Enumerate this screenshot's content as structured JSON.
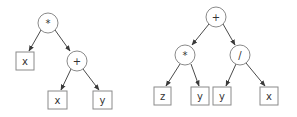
{
  "diagram": {
    "type": "expression-trees",
    "trees": [
      {
        "name": "tree-left",
        "expression": "x * (x + y)",
        "nodes": [
          {
            "id": "l0",
            "label": "*",
            "shape": "circle",
            "cx": 48,
            "cy": 23
          },
          {
            "id": "l1",
            "label": "x",
            "shape": "box",
            "cx": 25,
            "cy": 61
          },
          {
            "id": "l2",
            "label": "+",
            "shape": "circle",
            "cx": 77,
            "cy": 61
          },
          {
            "id": "l3",
            "label": "x",
            "shape": "box",
            "cx": 57,
            "cy": 100
          },
          {
            "id": "l4",
            "label": "y",
            "shape": "box",
            "cx": 102,
            "cy": 100
          }
        ],
        "edges": [
          [
            "l0",
            "l1"
          ],
          [
            "l0",
            "l2"
          ],
          [
            "l2",
            "l3"
          ],
          [
            "l2",
            "l4"
          ]
        ]
      },
      {
        "name": "tree-right",
        "expression": "(z * y) + (y / x)",
        "nodes": [
          {
            "id": "r0",
            "label": "+",
            "shape": "circle",
            "cx": 216,
            "cy": 17
          },
          {
            "id": "r1",
            "label": "*",
            "shape": "circle",
            "cx": 185,
            "cy": 55
          },
          {
            "id": "r2",
            "label": "/",
            "shape": "circle",
            "cx": 240,
            "cy": 55
          },
          {
            "id": "r3",
            "label": "z",
            "shape": "box",
            "cx": 162,
            "cy": 96
          },
          {
            "id": "r4",
            "label": "y",
            "shape": "box",
            "cx": 200,
            "cy": 96
          },
          {
            "id": "r5",
            "label": "y",
            "shape": "box",
            "cx": 222,
            "cy": 96
          },
          {
            "id": "r6",
            "label": "x",
            "shape": "box",
            "cx": 269,
            "cy": 96
          }
        ],
        "edges": [
          [
            "r0",
            "r1"
          ],
          [
            "r0",
            "r2"
          ],
          [
            "r1",
            "r3"
          ],
          [
            "r1",
            "r4"
          ],
          [
            "r2",
            "r5"
          ],
          [
            "r2",
            "r6"
          ]
        ]
      }
    ]
  },
  "labels": {
    "left": {
      "root": "*",
      "leaf_x1": "x",
      "plus": "+",
      "leaf_x2": "x",
      "leaf_y": "y"
    },
    "right": {
      "root": "+",
      "times": "*",
      "divide": "/",
      "leaf_z": "z",
      "leaf_y1": "y",
      "leaf_y2": "y",
      "leaf_x": "x"
    }
  },
  "colors": {
    "stroke": "#8a8a8a",
    "edge": "#4a4a4a",
    "text": "#333333",
    "background": "#ffffff"
  }
}
